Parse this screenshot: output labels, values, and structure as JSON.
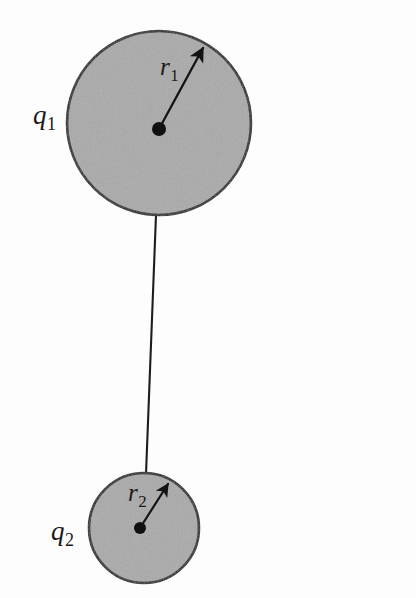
{
  "figure": {
    "background_color": "#fdfdfd",
    "sphere_fill_color": "#a9a9a9",
    "outline_color": "#1a1a1a",
    "labels": {
      "charge_1": {
        "base": "q",
        "subscript": "1"
      },
      "radius_1": {
        "base": "r",
        "subscript": "1"
      },
      "charge_2": {
        "base": "q",
        "subscript": "2"
      },
      "radius_2": {
        "base": "r",
        "subscript": "2"
      }
    },
    "shapes": {
      "large_sphere": {
        "cx": 159,
        "cy": 123,
        "r": 92
      },
      "large_center_dot": {
        "cx": 159,
        "cy": 129,
        "r": 7
      },
      "small_sphere": {
        "cx": 144,
        "cy": 528,
        "r": 55
      },
      "small_center_dot": {
        "cx": 140,
        "cy": 528,
        "r": 6
      },
      "radius_arrow_1": {
        "x1": 159,
        "y1": 129,
        "x2": 203,
        "y2": 48
      },
      "radius_arrow_2": {
        "x1": 140,
        "y1": 528,
        "x2": 168,
        "y2": 484
      },
      "connecting_wire": {
        "x1": 156,
        "y1": 215,
        "x2": 146,
        "y2": 474
      }
    }
  }
}
